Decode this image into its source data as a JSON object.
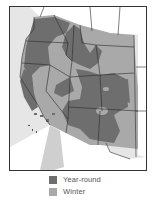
{
  "map": {
    "region": "Western United States",
    "colors": {
      "year_round": "#6e6e6e",
      "winter": "#a9a9a9",
      "outside": "#ffffff",
      "ocean": "#e4e4e4",
      "border": "#2a2a2a"
    }
  },
  "legend": {
    "items": [
      {
        "label": "Year-round",
        "color": "#6e6e6e"
      },
      {
        "label": "Winter",
        "color": "#a9a9a9"
      }
    ]
  }
}
